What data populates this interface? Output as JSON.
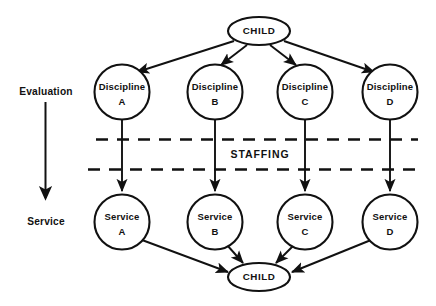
{
  "diagram": {
    "background_color": "#ffffff",
    "stroke_color": "#111111",
    "axis": {
      "top_label": "Evaluation",
      "bottom_label": "Service",
      "arrow_name": "downward-arrow"
    },
    "band": {
      "label": "STAFFING"
    },
    "top_node": {
      "label": "CHILD",
      "shape": "ellipse"
    },
    "bottom_node": {
      "label": "CHILD",
      "shape": "ellipse"
    },
    "evaluation_nodes": [
      {
        "line1": "Discipline",
        "line2": "A"
      },
      {
        "line1": "Discipline",
        "line2": "B"
      },
      {
        "line1": "Discipline",
        "line2": "C"
      },
      {
        "line1": "Discipline",
        "line2": "D"
      }
    ],
    "service_nodes": [
      {
        "line1": "Service",
        "line2": "A"
      },
      {
        "line1": "Service",
        "line2": "B"
      },
      {
        "line1": "Service",
        "line2": "C"
      },
      {
        "line1": "Service",
        "line2": "D"
      }
    ]
  }
}
